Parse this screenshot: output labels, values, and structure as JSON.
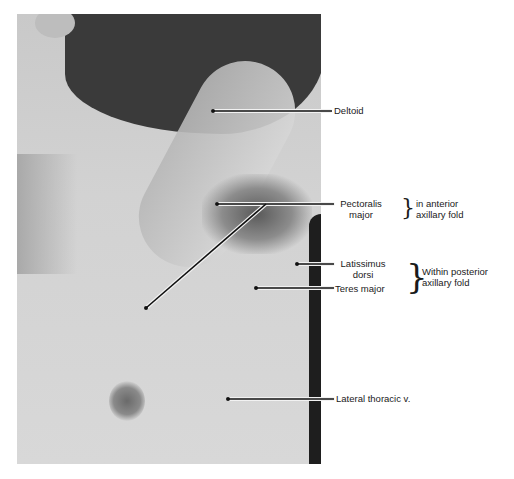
{
  "figure": {
    "type": "anatomical photograph",
    "region": "right axilla and anterior chest wall"
  },
  "labels": {
    "deltoid": "Deltoid",
    "pectoralis_line1": "Pectoralis",
    "pectoralis_line2": "major",
    "anterior_group_line1": "in anterior",
    "anterior_group_line2": "axillary fold",
    "latissimus_line1": "Latissimus",
    "latissimus_line2": "dorsi",
    "teres_major": "Teres major",
    "posterior_group_line1": "Within posterior",
    "posterior_group_line2": "axillary fold",
    "lateral_thoracic": "Lateral thoracic v."
  },
  "braces": {
    "anterior": "}",
    "posterior": "}"
  },
  "colors": {
    "leader_line": "#111111",
    "leader_halo": "#f2f2f2",
    "text": "#1a1a1a"
  }
}
